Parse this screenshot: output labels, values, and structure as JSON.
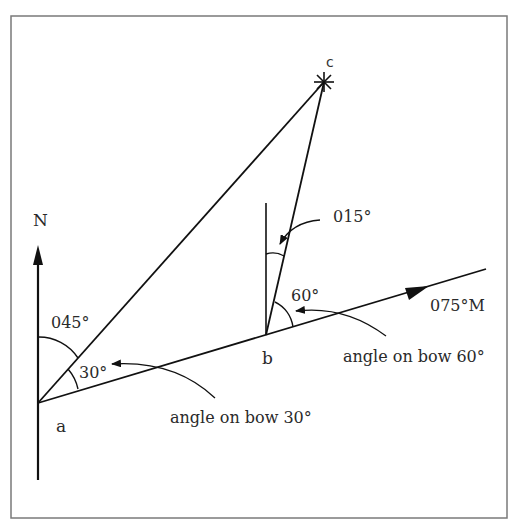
{
  "diagram": {
    "type": "relative bearing / angle on bow navigation diagram",
    "points": {
      "a": {
        "label": "a",
        "x": 38,
        "y": 403
      },
      "b": {
        "label": "b",
        "x": 266,
        "y": 335
      },
      "c": {
        "label": "c",
        "x": 324,
        "y": 82
      }
    },
    "north_label": "N",
    "course_label": "075°M",
    "bearing_from_a": "045°",
    "bearing_from_b": "015°",
    "angle_at_a": "30°",
    "angle_at_b": "60°",
    "angle_on_bow_a": "angle on bow 30°",
    "angle_on_bow_b": "angle on bow 60°"
  },
  "colors": {
    "line": "#111111",
    "text": "#2a2a2a",
    "frame": "#7a7a7a",
    "background": "#ffffff"
  }
}
